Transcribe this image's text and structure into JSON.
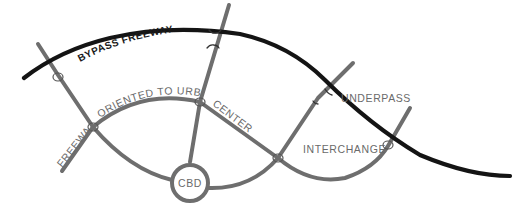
{
  "diagram": {
    "labels": {
      "bypass": "BYPASS FREEWAY",
      "radial_part1": "FREEWAY",
      "radial_part2": "ORIENTED TO URBAN",
      "radial_part3": "CENTER",
      "underpass": "UNDERPASS",
      "interchange": "INTERCHANGE",
      "cbd": "CBD"
    },
    "nodes": [
      {
        "id": "cbd",
        "label": "CBD",
        "type": "urban-center"
      },
      {
        "id": "interchange-west",
        "type": "interchange"
      },
      {
        "id": "interchange-left-ring",
        "type": "interchange"
      },
      {
        "id": "interchange-top-ring",
        "type": "interchange"
      },
      {
        "id": "interchange-mid-ring",
        "type": "interchange"
      },
      {
        "id": "interchange-east",
        "type": "interchange"
      },
      {
        "id": "underpass-north",
        "type": "underpass"
      },
      {
        "id": "underpass-east",
        "type": "underpass"
      }
    ],
    "colors": {
      "bypass": "#141414",
      "roads": "#6e6e6e",
      "labels": "#6a6a6a",
      "background": "#ffffff"
    }
  }
}
